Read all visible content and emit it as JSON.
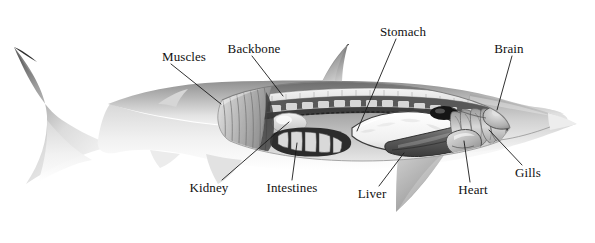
{
  "figure": {
    "view": "lateral left-facing-left cutaway",
    "background_color": "#ffffff",
    "ink_color": "#111111",
    "leader_line_color": "#1a1a1a",
    "width": 595,
    "height": 243
  },
  "labels": [
    {
      "id": "muscles",
      "text": "Muscles",
      "x": 184,
      "y": 57,
      "anchor": "middle",
      "leader": {
        "x1": 171,
        "y1": 64,
        "x2": 221,
        "y2": 104
      }
    },
    {
      "id": "backbone",
      "text": "Backbone",
      "x": 254,
      "y": 49,
      "anchor": "middle",
      "leader": {
        "x1": 252,
        "y1": 56,
        "x2": 283,
        "y2": 96
      }
    },
    {
      "id": "stomach",
      "text": "Stomach",
      "x": 403,
      "y": 32,
      "anchor": "middle",
      "leader": {
        "x1": 396,
        "y1": 39,
        "x2": 357,
        "y2": 131
      }
    },
    {
      "id": "brain",
      "text": "Brain",
      "x": 509,
      "y": 49,
      "anchor": "middle",
      "leader": {
        "x1": 512,
        "y1": 56,
        "x2": 497,
        "y2": 110
      }
    },
    {
      "id": "gills",
      "text": "Gills",
      "x": 528,
      "y": 173,
      "anchor": "middle",
      "leader": {
        "x1": 522,
        "y1": 165,
        "x2": 489,
        "y2": 130
      }
    },
    {
      "id": "heart",
      "text": "Heart",
      "x": 473,
      "y": 190,
      "anchor": "middle",
      "leader": {
        "x1": 470,
        "y1": 182,
        "x2": 464,
        "y2": 141
      }
    },
    {
      "id": "liver",
      "text": "Liver",
      "x": 372,
      "y": 194,
      "anchor": "middle",
      "leader": {
        "x1": 379,
        "y1": 186,
        "x2": 404,
        "y2": 153
      }
    },
    {
      "id": "intestines",
      "text": "Intestines",
      "x": 292,
      "y": 188,
      "anchor": "middle",
      "leader": {
        "x1": 292,
        "y1": 180,
        "x2": 297,
        "y2": 143
      }
    },
    {
      "id": "kidney",
      "text": "Kidney",
      "x": 209,
      "y": 188,
      "anchor": "middle",
      "leader": {
        "x1": 222,
        "y1": 180,
        "x2": 289,
        "y2": 122
      }
    }
  ],
  "anatomy_parts": [
    {
      "id": "body",
      "name": "shark-body-silhouette"
    },
    {
      "id": "caudal-fin",
      "name": "caudal-tail-fin"
    },
    {
      "id": "dorsal-fin-first",
      "name": "first-dorsal-fin"
    },
    {
      "id": "dorsal-fin-second",
      "name": "second-dorsal-fin"
    },
    {
      "id": "pectoral-fin",
      "name": "pectoral-fin"
    },
    {
      "id": "pelvic-fin",
      "name": "pelvic-fin"
    },
    {
      "id": "anal-fin",
      "name": "anal-fin"
    },
    {
      "id": "muscles-block",
      "name": "muscle-cross-section"
    },
    {
      "id": "backbone-column",
      "name": "vertebral-column"
    },
    {
      "id": "stomach-organ",
      "name": "stomach-organ"
    },
    {
      "id": "liver-organ",
      "name": "liver-organ"
    },
    {
      "id": "intestine-organ",
      "name": "spiral-valve-intestine"
    },
    {
      "id": "kidney-organ",
      "name": "kidney-organ"
    },
    {
      "id": "heart-organ",
      "name": "heart-organ"
    },
    {
      "id": "gill-arches",
      "name": "gill-arches"
    },
    {
      "id": "brain-organ",
      "name": "brain-organ"
    },
    {
      "id": "eye",
      "name": "eye"
    },
    {
      "id": "body-cavity",
      "name": "body-cavity-cutaway"
    }
  ]
}
